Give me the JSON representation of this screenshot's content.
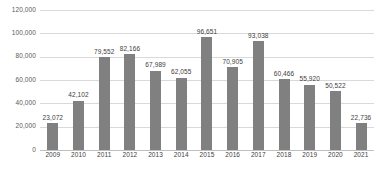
{
  "chart_data": {
    "type": "bar",
    "title": "",
    "subtitle": "",
    "xlabel": "",
    "ylabel": "",
    "categories": [
      "2009",
      "2010",
      "2011",
      "2012",
      "2013",
      "2014",
      "2015",
      "2016",
      "2017",
      "2018",
      "2019",
      "2020",
      "2021"
    ],
    "values": [
      23072,
      42102,
      79552,
      82166,
      67989,
      62055,
      96651,
      70905,
      93038,
      60466,
      55920,
      50522,
      22736
    ],
    "data_labels": [
      "23,072",
      "42,102",
      "79,552",
      "82,166",
      "67,989",
      "62,055",
      "96,651",
      "70,905",
      "93,038",
      "60,466",
      "55,920",
      "50,522",
      "22,736"
    ],
    "ylim": [
      0,
      120000
    ],
    "ytick_values": [
      0,
      20000,
      40000,
      60000,
      80000,
      100000,
      120000
    ],
    "ytick_labels": [
      "0",
      "20,000",
      "40,000",
      "60,000",
      "80,000",
      "100,000",
      "120,000"
    ],
    "grid": true,
    "legend": null,
    "legend_position": "none",
    "series_color": "#808080",
    "gridline_color": "#d9d9d9",
    "background_color": "#ffffff"
  }
}
